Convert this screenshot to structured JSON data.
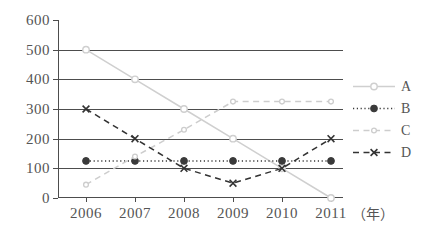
{
  "chart_data": {
    "type": "line",
    "title": "",
    "xlabel": "(年)",
    "ylabel": "",
    "x": [
      "2006",
      "2007",
      "2008",
      "2009",
      "2010",
      "2011"
    ],
    "categories": [
      "2006",
      "2007",
      "2008",
      "2009",
      "2010",
      "2011"
    ],
    "ylim": [
      0,
      600
    ],
    "ytick_labels": [
      "0",
      "100",
      "200",
      "300",
      "400",
      "500",
      "600"
    ],
    "ytick_values": [
      0,
      100,
      200,
      300,
      400,
      500,
      600
    ],
    "ystep": 100,
    "grid": true,
    "gridlines_at": [
      100,
      200,
      300,
      400,
      500
    ],
    "legend_position": "right",
    "series": [
      {
        "name": "A",
        "values": [
          500,
          400,
          300,
          200,
          100,
          0
        ],
        "color": "#cfcfcf",
        "line_style": "solid",
        "marker": "open-circle"
      },
      {
        "name": "B",
        "values": [
          125,
          125,
          125,
          125,
          125,
          125
        ],
        "color": "#3a3a3a",
        "line_style": "dotted",
        "marker": "filled-circle"
      },
      {
        "name": "C",
        "values": [
          45,
          140,
          230,
          325,
          325,
          325
        ],
        "color": "#cdcdcd",
        "line_style": "dashed",
        "marker": "small-open-circle"
      },
      {
        "name": "D",
        "values": [
          300,
          200,
          100,
          50,
          100,
          200
        ],
        "color": "#333333",
        "line_style": "dashed",
        "marker": "cross"
      }
    ]
  },
  "axes": {
    "y_labels": [
      "600",
      "500",
      "400",
      "300",
      "200",
      "100",
      "0"
    ],
    "x_labels": [
      "2006",
      "2007",
      "2008",
      "2009",
      "2010",
      "2011"
    ],
    "x_unit": "（年）"
  },
  "legend": {
    "entries": [
      {
        "label": "A"
      },
      {
        "label": "B"
      },
      {
        "label": "C"
      },
      {
        "label": "D"
      }
    ]
  },
  "colors": {
    "axis": "#4d4d4d",
    "grid": "#4d4d4d",
    "text": "#555555",
    "series_a": "#cfcfcf",
    "series_b": "#3a3a3a",
    "series_c": "#cdcdcd",
    "series_d": "#333333",
    "background": "#ffffff"
  }
}
